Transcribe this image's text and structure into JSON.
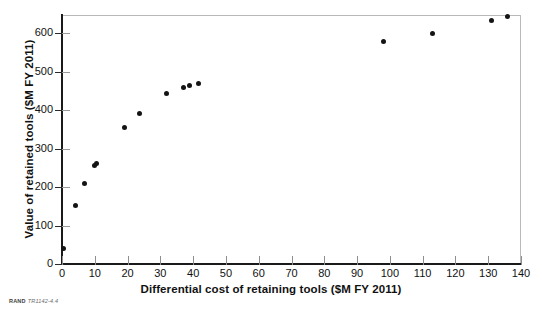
{
  "chart_data": {
    "type": "scatter",
    "title": "",
    "xlabel": "Differential cost of retaining tools ($M FY 2011)",
    "ylabel": "Value of retained tools ($M FY 2011)",
    "xlim": [
      0,
      140
    ],
    "ylim": [
      0,
      650
    ],
    "xticks": [
      0,
      10,
      20,
      30,
      40,
      50,
      60,
      70,
      80,
      90,
      100,
      110,
      120,
      130,
      140
    ],
    "yticks": [
      0,
      100,
      200,
      300,
      400,
      500,
      600
    ],
    "grid": false,
    "legend": null,
    "marker_color": "#141414",
    "points": [
      {
        "x": 0.5,
        "y": 40
      },
      {
        "x": 4,
        "y": 152
      },
      {
        "x": 7,
        "y": 210
      },
      {
        "x": 10,
        "y": 255
      },
      {
        "x": 10.6,
        "y": 262
      },
      {
        "x": 19,
        "y": 355
      },
      {
        "x": 23.5,
        "y": 392
      },
      {
        "x": 32,
        "y": 442
      },
      {
        "x": 37,
        "y": 458
      },
      {
        "x": 39,
        "y": 463
      },
      {
        "x": 41.5,
        "y": 470
      },
      {
        "x": 98,
        "y": 577
      },
      {
        "x": 113,
        "y": 600
      },
      {
        "x": 131,
        "y": 632
      },
      {
        "x": 136,
        "y": 642
      }
    ]
  },
  "credit": {
    "brand": "RAND",
    "figure_number": "TR1142-4.4"
  }
}
